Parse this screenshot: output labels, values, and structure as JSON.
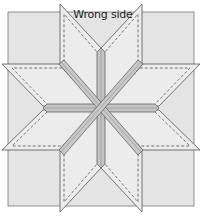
{
  "diagram": {
    "title": "Wrong side",
    "colors": {
      "background_square": "#e4e4e4",
      "diamond_fill": "#ececec",
      "seam_fill": "#c4c4c4",
      "seam_highlight": "#dcdcdc",
      "outline": "#555555",
      "stitch_line": "#444444"
    }
  }
}
